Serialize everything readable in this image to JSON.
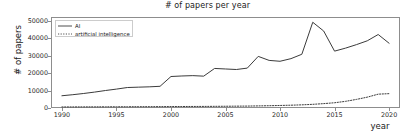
{
  "chart_data": {
    "type": "line",
    "title": "# of papers per year",
    "xlabel": "year",
    "ylabel": "# of papers",
    "xlim": [
      1989,
      2021
    ],
    "ylim": [
      0,
      52000
    ],
    "grid": false,
    "legend_position": "upper left",
    "xticks": [
      1990,
      1995,
      2000,
      2005,
      2010,
      2015,
      2020
    ],
    "xtick_labels": [
      "1990",
      "1995",
      "2000",
      "2005",
      "2010",
      "2015",
      "2020"
    ],
    "yticks": [
      0,
      10000,
      20000,
      30000,
      40000,
      50000
    ],
    "ytick_labels": [
      "0",
      "10000",
      "20000",
      "30000",
      "40000",
      "50000"
    ],
    "x": [
      1990,
      1991,
      1992,
      1993,
      1994,
      1995,
      1996,
      1997,
      1998,
      1999,
      2000,
      2001,
      2002,
      2003,
      2004,
      2005,
      2006,
      2007,
      2008,
      2009,
      2010,
      2011,
      2012,
      2013,
      2014,
      2015,
      2016,
      2017,
      2018,
      2019,
      2020
    ],
    "series": [
      {
        "name": "AI",
        "linestyle": "solid",
        "color": "#3b3b3b",
        "values": [
          7000,
          7600,
          8300,
          9100,
          10000,
          10800,
          11700,
          11900,
          12100,
          12400,
          18000,
          18300,
          18500,
          18200,
          22600,
          22300,
          22000,
          22800,
          29500,
          27200,
          26700,
          28200,
          30700,
          49000,
          44000,
          32500,
          34200,
          36200,
          38400,
          42000,
          37000
        ]
      },
      {
        "name": "artificial intelligence",
        "linestyle": "dotted",
        "color": "#3b3b3b",
        "values": [
          600,
          620,
          640,
          660,
          680,
          700,
          720,
          740,
          760,
          780,
          820,
          850,
          880,
          900,
          950,
          1000,
          1050,
          1100,
          1200,
          1300,
          1450,
          1600,
          1800,
          2100,
          2500,
          3000,
          3800,
          4900,
          6200,
          7900,
          8200
        ]
      }
    ]
  }
}
